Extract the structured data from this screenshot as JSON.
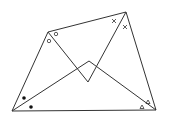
{
  "diagram": {
    "type": "geometry",
    "stroke_color": "#333333",
    "background": "#ffffff",
    "vertices": {
      "A": [
        12,
        111
      ],
      "B": [
        48,
        32
      ],
      "C": [
        126,
        12
      ],
      "D": [
        156,
        110
      ],
      "E": [
        88,
        82
      ],
      "F": [
        89,
        61
      ]
    },
    "edges": [
      [
        "A",
        "B"
      ],
      [
        "B",
        "C"
      ],
      [
        "C",
        "D"
      ],
      [
        "D",
        "A"
      ],
      [
        "B",
        "E"
      ],
      [
        "E",
        "C"
      ],
      [
        "A",
        "F"
      ],
      [
        "F",
        "D"
      ]
    ],
    "angle_marks": [
      {
        "vertex": "B",
        "symbol": "circle",
        "count": 2,
        "glyph": "o"
      },
      {
        "vertex": "C",
        "symbol": "cross",
        "count": 2,
        "glyph": "×"
      },
      {
        "vertex": "A",
        "symbol": "dot",
        "count": 2,
        "glyph": "•"
      },
      {
        "vertex": "D",
        "symbol": "triangle",
        "count": 2,
        "glyph": "△"
      }
    ]
  }
}
